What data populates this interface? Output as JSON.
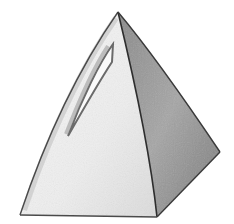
{
  "image": {
    "subject": "pencil sketch of a tetrahedral pyramid",
    "width": 234,
    "height": 224,
    "background": "#ffffff",
    "colors": {
      "light_face": "#efefef",
      "light_face_shade": "#d9d9d9",
      "dark_face": "#9a9a9a",
      "dark_face_deep": "#7d7d7d",
      "edge": "#3a3a3a",
      "slot_fill": "#fafafa",
      "slot_edge": "#6a6a6a"
    },
    "geometry": {
      "apex": [
        118,
        12
      ],
      "bottom_left": [
        20,
        215
      ],
      "front_corner": [
        157,
        217
      ],
      "right_corner": [
        220,
        152
      ]
    }
  }
}
